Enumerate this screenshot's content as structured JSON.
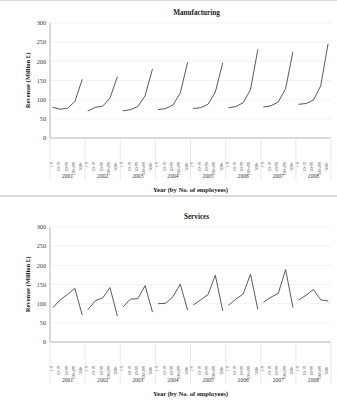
{
  "figure": {
    "background_color": "#ffffff",
    "line_color": "#3c3c3c",
    "grid_color": "#e9e9e9"
  },
  "chart_data": [
    {
      "type": "line",
      "title": "Manufacturing",
      "xlabel": "Year (by No. of employees)",
      "ylabel": "Revenue (Million £)",
      "ylim": [
        0,
        300
      ],
      "yticks": [
        0,
        50,
        100,
        150,
        200,
        250,
        300
      ],
      "grid": true,
      "legend": "none",
      "size_categories": [
        "1-9",
        "10-19",
        "20-99",
        "100-499",
        "500+"
      ],
      "groups": [
        "2001",
        "2002",
        "2003",
        "2004",
        "2005",
        "2006",
        "2007",
        "2008"
      ],
      "series": [
        {
          "name": "2001",
          "values": [
            80,
            75,
            78,
            95,
            152
          ]
        },
        {
          "name": "2002",
          "values": [
            71,
            80,
            83,
            104,
            159
          ]
        },
        {
          "name": "2003",
          "values": [
            71,
            74,
            82,
            110,
            179
          ]
        },
        {
          "name": "2004",
          "values": [
            74,
            77,
            86,
            117,
            196
          ]
        },
        {
          "name": "2005",
          "values": [
            77,
            79,
            88,
            120,
            195
          ]
        },
        {
          "name": "2006",
          "values": [
            79,
            82,
            92,
            126,
            230
          ]
        },
        {
          "name": "2007",
          "values": [
            81,
            84,
            94,
            129,
            224
          ]
        },
        {
          "name": "2008",
          "values": [
            88,
            90,
            99,
            136,
            245
          ]
        }
      ]
    },
    {
      "type": "line",
      "title": "Services",
      "xlabel": "Year (by No. of employees)",
      "ylabel": "Revenue (Million £)",
      "ylim": [
        0,
        300
      ],
      "yticks": [
        0,
        50,
        100,
        150,
        200,
        250,
        300
      ],
      "grid": true,
      "legend": "none",
      "size_categories": [
        "1-9",
        "10-19",
        "20-99",
        "100-499",
        "500+"
      ],
      "groups": [
        "2001",
        "2002",
        "2003",
        "2004",
        "2005",
        "2006",
        "2007",
        "2008"
      ],
      "series": [
        {
          "name": "2001",
          "values": [
            90,
            110,
            124,
            140,
            71
          ]
        },
        {
          "name": "2002",
          "values": [
            85,
            108,
            115,
            142,
            69
          ]
        },
        {
          "name": "2003",
          "values": [
            92,
            112,
            113,
            147,
            79
          ]
        },
        {
          "name": "2004",
          "values": [
            100,
            101,
            118,
            151,
            84
          ]
        },
        {
          "name": "2005",
          "values": [
            97,
            110,
            124,
            174,
            82
          ]
        },
        {
          "name": "2006",
          "values": [
            96,
            112,
            125,
            177,
            86
          ]
        },
        {
          "name": "2007",
          "values": [
            104,
            117,
            127,
            189,
            91
          ]
        },
        {
          "name": "2008",
          "values": [
            110,
            122,
            137,
            110,
            107
          ]
        }
      ]
    }
  ]
}
